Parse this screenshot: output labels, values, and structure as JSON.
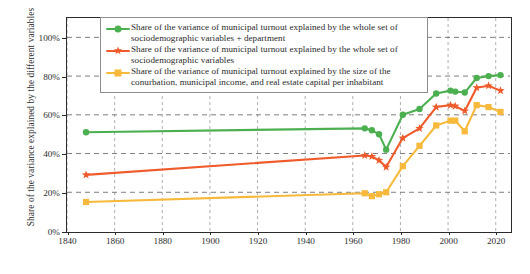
{
  "chart_data": {
    "type": "line",
    "title": "",
    "xlabel": "",
    "ylabel": "Share of the variance explained by the different variables",
    "xlim": [
      1840,
      2026
    ],
    "ylim": [
      0,
      110
    ],
    "grid": true,
    "legend_position": "top-center",
    "x_ticks": [
      1840,
      1860,
      1880,
      1900,
      1920,
      1940,
      1960,
      1980,
      2000,
      2020
    ],
    "x_tick_labels": [
      "1840",
      "1860",
      "1880",
      "1900",
      "1920",
      "1940",
      "1960",
      "1980",
      "2000",
      "2020"
    ],
    "y_ticks": [
      0,
      20,
      40,
      60,
      80,
      100
    ],
    "y_tick_labels": [
      "0%",
      "20%",
      "40%",
      "60%",
      "80%",
      "100%"
    ],
    "series": [
      {
        "name": "Share of the variance of municipal turnout explained by the whole set of sociodemographic variables + department",
        "color": "#4caf50",
        "marker": "circle",
        "x": [
          1848,
          1965,
          1968,
          1971,
          1974,
          1981,
          1988,
          1995,
          2001,
          2003,
          2007,
          2012,
          2017,
          2022
        ],
        "values": [
          51,
          53,
          52,
          50,
          42,
          60,
          63,
          71,
          72.5,
          72,
          71.5,
          79,
          80,
          80.5
        ]
      },
      {
        "name": "Share of the variance of municipal turnout explained by the whole set of sociodemographic variables",
        "color": "#ef5b2b",
        "marker": "star",
        "x": [
          1848,
          1965,
          1968,
          1971,
          1974,
          1981,
          1988,
          1995,
          2001,
          2003,
          2007,
          2012,
          2017,
          2022
        ],
        "values": [
          29,
          39,
          38.5,
          36.5,
          33,
          48,
          53,
          64,
          65,
          64.5,
          62,
          74,
          75,
          72.5
        ]
      },
      {
        "name": "Share of the variance of municipal turnout explained by the size of the conurbation, municipal income, and real estate capital per inhabitant",
        "color": "#f6b93b",
        "marker": "square",
        "x": [
          1848,
          1965,
          1968,
          1971,
          1974,
          1981,
          1988,
          1995,
          2001,
          2003,
          2007,
          2012,
          2017,
          2022
        ],
        "values": [
          15,
          19.5,
          18,
          19,
          20,
          33.5,
          44,
          54.5,
          57,
          57,
          51.5,
          65,
          64,
          61.5
        ]
      }
    ]
  },
  "legend": {
    "items": [
      {
        "marker": "circle-marker",
        "color": "#4caf50",
        "label": "Share of the variance of municipal turnout explained by the whole set of sociodemographic variables + department"
      },
      {
        "marker": "star-marker",
        "color": "#ef5b2b",
        "label": "Share of the variance of municipal turnout explained by the whole set of sociodemographic variables"
      },
      {
        "marker": "square-marker",
        "color": "#f6b93b",
        "label": "Share of the variance of municipal turnout explained by the size of the conurbation, municipal income, and real estate capital per inhabitant"
      }
    ]
  },
  "axes": {
    "y_title": "Share of the variance explained by the different variables"
  }
}
